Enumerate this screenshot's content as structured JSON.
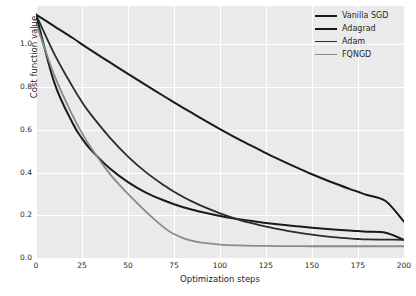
{
  "chart_data": {
    "type": "line",
    "title": "",
    "xlabel": "Optimization steps",
    "ylabel": "Cost function value",
    "xlim": [
      0,
      200
    ],
    "ylim": [
      0.0,
      1.18
    ],
    "xticks": [
      0,
      25,
      50,
      75,
      100,
      125,
      150,
      175,
      200
    ],
    "xtick_labels": [
      "0",
      "25",
      "50",
      "75",
      "100",
      "125",
      "150",
      "175",
      "200"
    ],
    "yticks": [
      0.0,
      0.2,
      0.4,
      0.6,
      0.8,
      1.0
    ],
    "ytick_labels": [
      "0.0",
      "0.2",
      "0.4",
      "0.6",
      "0.8",
      "1.0"
    ],
    "grid": true,
    "grid_color": "#ffffff",
    "axes_facecolor": "#eaeaea",
    "legend_position": "upper right",
    "legend_frame": false,
    "x": [
      0,
      10,
      20,
      25,
      30,
      40,
      50,
      60,
      70,
      75,
      80,
      85,
      90,
      100,
      110,
      120,
      125,
      130,
      140,
      150,
      160,
      170,
      175,
      180,
      190,
      200
    ],
    "series": [
      {
        "name": "Vanilla SGD",
        "color": "#1a1a1a",
        "linewidth": 2.0,
        "values": [
          1.14,
          1.085,
          1.03,
          1.0,
          0.972,
          0.917,
          0.862,
          0.808,
          0.755,
          0.729,
          0.703,
          0.678,
          0.653,
          0.604,
          0.557,
          0.513,
          0.491,
          0.47,
          0.43,
          0.392,
          0.357,
          0.325,
          0.31,
          0.295,
          0.267,
          0.17
        ]
      },
      {
        "name": "Adagrad",
        "color": "#1a1a1a",
        "linewidth": 2.0,
        "values": [
          1.14,
          0.82,
          0.63,
          0.56,
          0.505,
          0.42,
          0.355,
          0.305,
          0.268,
          0.252,
          0.238,
          0.226,
          0.215,
          0.197,
          0.182,
          0.17,
          0.164,
          0.159,
          0.15,
          0.142,
          0.135,
          0.129,
          0.126,
          0.123,
          0.118,
          0.085
        ]
      },
      {
        "name": "Adam",
        "color": "#2b2b2b",
        "linewidth": 1.8,
        "values": [
          1.14,
          0.955,
          0.8,
          0.73,
          0.67,
          0.565,
          0.475,
          0.4,
          0.338,
          0.31,
          0.286,
          0.264,
          0.244,
          0.209,
          0.18,
          0.157,
          0.147,
          0.138,
          0.122,
          0.109,
          0.099,
          0.092,
          0.089,
          0.087,
          0.086,
          0.085
        ]
      },
      {
        "name": "FQNGD",
        "color": "#8a8a8a",
        "linewidth": 1.8,
        "values": [
          1.1,
          0.855,
          0.665,
          0.585,
          0.515,
          0.395,
          0.3,
          0.215,
          0.14,
          0.112,
          0.093,
          0.08,
          0.072,
          0.063,
          0.059,
          0.057,
          0.0565,
          0.056,
          0.0555,
          0.055,
          0.055,
          0.055,
          0.055,
          0.055,
          0.055,
          0.055
        ]
      }
    ]
  }
}
